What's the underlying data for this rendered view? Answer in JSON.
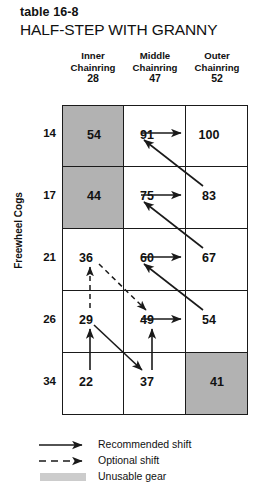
{
  "header": {
    "table_number": "table 16-8",
    "title": "HALF-STEP WITH GRANNY"
  },
  "axes": {
    "y_label": "Freewheel Cogs",
    "row_labels": [
      "14",
      "17",
      "21",
      "26",
      "34"
    ]
  },
  "columns": [
    {
      "name": "Inner",
      "sub": "Chainring",
      "teeth": "28"
    },
    {
      "name": "Middle",
      "sub": "Chainring",
      "teeth": "47"
    },
    {
      "name": "Outer",
      "sub": "Chainring",
      "teeth": "52"
    }
  ],
  "grid": {
    "rows": [
      {
        "cog": "14",
        "cells": [
          {
            "value": "54",
            "unusable": true
          },
          {
            "value": "91",
            "unusable": false
          },
          {
            "value": "100",
            "unusable": false
          }
        ]
      },
      {
        "cog": "17",
        "cells": [
          {
            "value": "44",
            "unusable": true
          },
          {
            "value": "75",
            "unusable": false
          },
          {
            "value": "83",
            "unusable": false
          }
        ]
      },
      {
        "cog": "21",
        "cells": [
          {
            "value": "36",
            "unusable": false
          },
          {
            "value": "60",
            "unusable": false
          },
          {
            "value": "67",
            "unusable": false
          }
        ]
      },
      {
        "cog": "26",
        "cells": [
          {
            "value": "29",
            "unusable": false
          },
          {
            "value": "49",
            "unusable": false
          },
          {
            "value": "54",
            "unusable": false
          }
        ]
      },
      {
        "cog": "34",
        "cells": [
          {
            "value": "22",
            "unusable": false
          },
          {
            "value": "37",
            "unusable": false
          },
          {
            "value": "41",
            "unusable": true
          }
        ]
      }
    ]
  },
  "shifts": {
    "recommended": [
      {
        "from": "91",
        "to": "100"
      },
      {
        "from": "83",
        "to": "91"
      },
      {
        "from": "75",
        "to": "83"
      },
      {
        "from": "67",
        "to": "75"
      },
      {
        "from": "60",
        "to": "67"
      },
      {
        "from": "54",
        "to": "60"
      },
      {
        "from": "49",
        "to": "54"
      },
      {
        "from": "37",
        "to": "49"
      },
      {
        "from": "29",
        "to": "37"
      },
      {
        "from": "22",
        "to": "29"
      }
    ],
    "optional": [
      {
        "from": "29",
        "to": "36"
      },
      {
        "from": "36",
        "to": "49"
      }
    ]
  },
  "legend": [
    {
      "kind": "solid-arrow",
      "label": "Recommended shift"
    },
    {
      "kind": "dashed-arrow",
      "label": "Optional shift"
    },
    {
      "kind": "swatch",
      "label": "Unusable gear"
    }
  ],
  "colors": {
    "unusable_fill": "#b2b2b2",
    "legend_swatch": "#cccccc",
    "line": "#1a1a1a",
    "text": "#111111"
  }
}
